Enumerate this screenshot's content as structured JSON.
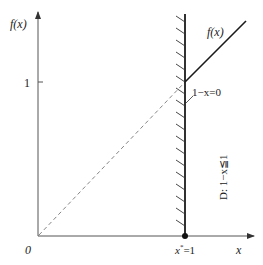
{
  "diagram": {
    "y_axis_label": "f(x)",
    "x_axis_label": "x",
    "origin_label": "0",
    "y_tick_label": "1",
    "x_point_label": "x*=1",
    "x_point_base": "x",
    "x_point_sup": "*",
    "x_point_rest": "=1",
    "curve_label": "f(x)",
    "boundary_label": "1−x=0",
    "region_label": "D: 1−x≦1",
    "colors": {
      "line": "#1a1a1a",
      "axis": "#555555",
      "dashed": "#777777",
      "text": "#222222"
    }
  }
}
